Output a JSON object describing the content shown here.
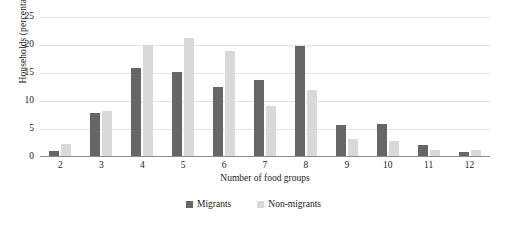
{
  "chart_data": {
    "type": "bar",
    "title": "",
    "xlabel": "Number of food groups",
    "ylabel": "Households (percentage)",
    "categories": [
      "2",
      "3",
      "4",
      "5",
      "6",
      "7",
      "8",
      "9",
      "10",
      "11",
      "12"
    ],
    "series": [
      {
        "name": "Migrants",
        "color": "#666666",
        "values": [
          0.9,
          7.6,
          15.7,
          15.0,
          12.4,
          13.5,
          19.7,
          5.5,
          5.8,
          2.0,
          0.8
        ]
      },
      {
        "name": "Non-migrants",
        "color": "#d9d9d9",
        "values": [
          2.2,
          8.1,
          19.8,
          21.0,
          18.8,
          9.0,
          11.8,
          3.0,
          2.6,
          1.0,
          1.1
        ]
      }
    ],
    "ylim": [
      0,
      25
    ],
    "yticks": [
      25,
      20,
      15,
      10,
      5,
      0
    ],
    "grid": true,
    "legend_position": "bottom-center"
  }
}
